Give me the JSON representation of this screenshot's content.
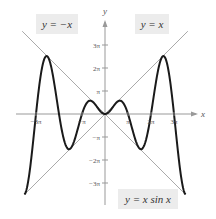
{
  "chart_data": {
    "type": "line",
    "title": "",
    "xlabel": "x",
    "ylabel": "y",
    "xlim": [
      -3.5,
      3.5
    ],
    "ylim": [
      -3.5,
      4.2
    ],
    "units": "pi",
    "grid": false,
    "x_ticks": [
      {
        "value": -3,
        "label": "−3π"
      },
      {
        "value": -1,
        "label": "−π"
      },
      {
        "value": 1,
        "label": "π"
      },
      {
        "value": 2,
        "label": "2π"
      },
      {
        "value": 3,
        "label": "3π"
      }
    ],
    "y_ticks": [
      {
        "value": 3,
        "label": "3π"
      },
      {
        "value": 2,
        "label": "2π"
      },
      {
        "value": 1,
        "label": "π"
      },
      {
        "value": -1,
        "label": "−π"
      },
      {
        "value": -2,
        "label": "−2π"
      },
      {
        "value": -3,
        "label": "−3π"
      }
    ],
    "series": [
      {
        "name": "y = x sin x",
        "function": "x*sin(x)",
        "domain_pi": [
          -3.5,
          3.5
        ],
        "color": "#1a1a1a",
        "width": 2
      },
      {
        "name": "y = x",
        "function": "x",
        "domain_pi": [
          -3.5,
          3.6
        ],
        "color": "#aaaaaa",
        "width": 1
      },
      {
        "name": "y = −x",
        "function": "-x",
        "domain_pi": [
          -3.6,
          3.5
        ],
        "color": "#aaaaaa",
        "width": 1
      }
    ],
    "annotations": [
      {
        "text": "y = −x",
        "position": "top-left"
      },
      {
        "text": "y = x",
        "position": "top-right"
      },
      {
        "text": "y = x sin x",
        "position": "bottom-right"
      }
    ]
  },
  "labels": {
    "neg_x": "y = −x",
    "pos_x": "y = x",
    "xsinx": "y = x sin x",
    "x_axis": "x",
    "y_axis": "y"
  }
}
